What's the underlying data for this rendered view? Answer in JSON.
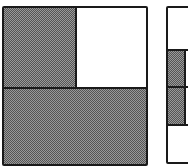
{
  "figure": {
    "panels": [
      {
        "id": "left-square",
        "regions": [
          {
            "name": "top-left",
            "filled": true
          },
          {
            "name": "top-right",
            "filled": false
          },
          {
            "name": "bottom",
            "filled": true
          }
        ]
      },
      {
        "id": "right-square",
        "regions": [
          {
            "name": "top",
            "filled": false
          },
          {
            "name": "middle-upper",
            "filled": true
          },
          {
            "name": "middle-lower",
            "filled": true
          },
          {
            "name": "bottom",
            "filled": false
          }
        ]
      }
    ],
    "colors": {
      "outline": "#1a1a1a",
      "fill_pattern": "#9a9a9a",
      "background": "#ffffff"
    }
  }
}
